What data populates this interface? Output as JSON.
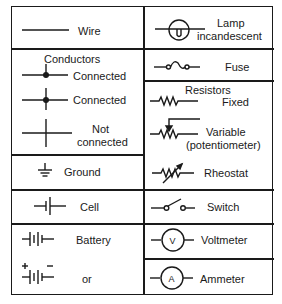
{
  "colors": {
    "line": "#1a1a1a",
    "background": "#ffffff"
  },
  "left": [
    {
      "id": "wire",
      "labels": [
        "Wire"
      ],
      "icon": "wire-icon"
    },
    {
      "id": "conductors",
      "heading": "Conductors",
      "labels": [
        "Connected"
      ],
      "icon": "conductor-junction-tee-icon"
    },
    {
      "id": "connected",
      "labels": [
        "Connected"
      ],
      "icon": "conductor-junction-cross-icon"
    },
    {
      "id": "not-connected",
      "labels": [
        "Not",
        "connected"
      ],
      "icon": "conductor-crossover-icon"
    },
    {
      "id": "ground",
      "labels": [
        "Ground"
      ],
      "icon": "ground-icon"
    },
    {
      "id": "cell",
      "labels": [
        "Cell"
      ],
      "icon": "cell-icon"
    },
    {
      "id": "battery",
      "labels": [
        "Battery"
      ],
      "icon": "battery-icon"
    },
    {
      "id": "battery-alt",
      "labels": [
        "or"
      ],
      "icon": "battery-polarity-icon",
      "plus": "+",
      "minus": "−"
    }
  ],
  "right": [
    {
      "id": "lamp",
      "labels": [
        "Lamp",
        "incandescent"
      ],
      "icon": "lamp-icon"
    },
    {
      "id": "fuse",
      "labels": [
        "Fuse"
      ],
      "icon": "fuse-icon"
    },
    {
      "id": "resistor-fixed",
      "heading": "Resistors",
      "labels": [
        "Fixed"
      ],
      "icon": "resistor-icon"
    },
    {
      "id": "resistor-variable",
      "labels": [
        "Variable",
        "(potentiometer)"
      ],
      "icon": "potentiometer-icon"
    },
    {
      "id": "rheostat",
      "labels": [
        "Rheostat"
      ],
      "icon": "rheostat-icon"
    },
    {
      "id": "switch",
      "labels": [
        "Switch"
      ],
      "icon": "switch-icon"
    },
    {
      "id": "voltmeter",
      "labels": [
        "Voltmeter"
      ],
      "icon": "voltmeter-icon",
      "meter_letter": "V"
    },
    {
      "id": "ammeter",
      "labels": [
        "Ammeter"
      ],
      "icon": "ammeter-icon",
      "meter_letter": "A"
    }
  ]
}
